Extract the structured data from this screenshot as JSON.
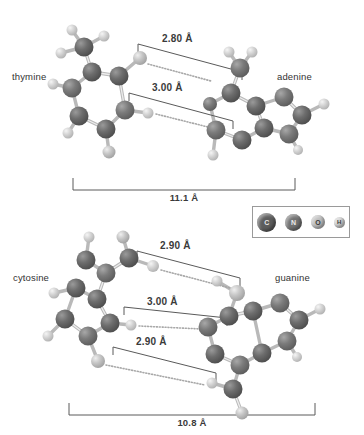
{
  "figure": {
    "units": "Å"
  },
  "legend": {
    "name": "atom-type-legend",
    "atoms": [
      {
        "symbol": "C",
        "label": "carbon",
        "color": "#5d5d5d",
        "size": 19
      },
      {
        "symbol": "N",
        "label": "nitrogen",
        "color": "#727272",
        "size": 17
      },
      {
        "symbol": "O",
        "label": "oxygen",
        "color": "#bdbdbd",
        "size": 14
      },
      {
        "symbol": "H",
        "label": "hydrogen",
        "color": "#cfcfcf",
        "size": 11
      }
    ]
  },
  "panels": [
    {
      "id": "thymine-adenine",
      "left_label": "thymine",
      "right_label": "adenine",
      "hydrogen_bonds": [
        {
          "label": "2.80 Å",
          "value": 2.8
        },
        {
          "label": "3.00 Å",
          "value": 3.0
        }
      ],
      "span": {
        "label": "11.1 Å",
        "value": 11.1
      }
    },
    {
      "id": "cytosine-guanine",
      "left_label": "cytosine",
      "right_label": "guanine",
      "hydrogen_bonds": [
        {
          "label": "2.90 Å",
          "value": 2.9
        },
        {
          "label": "3.00 Å",
          "value": 3.0
        },
        {
          "label": "2.90 Å",
          "value": 2.9
        }
      ],
      "span": {
        "label": "10.8 Å",
        "value": 10.8
      }
    }
  ]
}
